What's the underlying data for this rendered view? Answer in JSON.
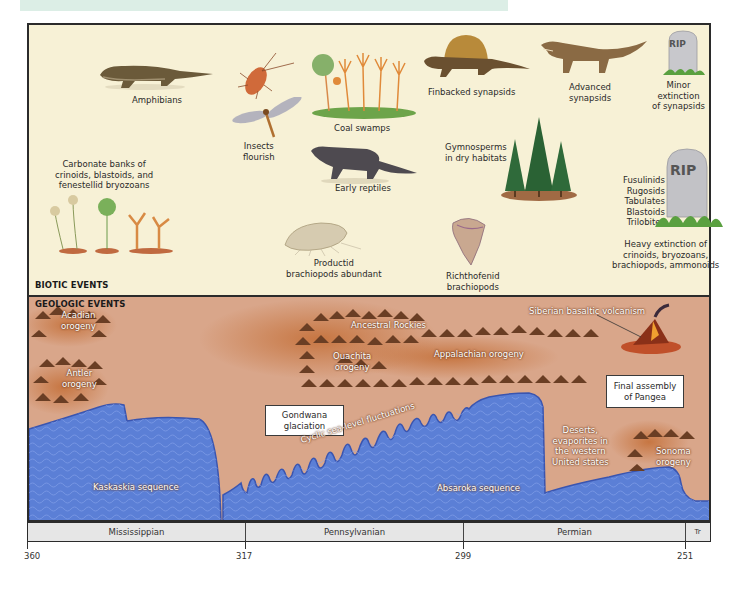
{
  "header": {
    "title_band_color": "#dceee6"
  },
  "biotic": {
    "section_label": "BIOTIC EVENTS",
    "background": "#f7f1d6",
    "events": [
      {
        "id": "amphibians",
        "label": "Amphibians"
      },
      {
        "id": "insects",
        "label_line1": "Insects",
        "label_line2": "flourish"
      },
      {
        "id": "coal-swamps",
        "label": "Coal swamps"
      },
      {
        "id": "finbacked",
        "label": "Finbacked synapsids"
      },
      {
        "id": "advanced",
        "label_line1": "Advanced",
        "label_line2": "synapsids"
      },
      {
        "id": "minor-extinction",
        "label_line1": "Minor",
        "label_line2": "extinction",
        "label_line3": "of synapsids",
        "tombstone": "RIP"
      },
      {
        "id": "carbonate-banks",
        "label_line1": "Carbonate banks of",
        "label_line2": "crinoids, blastoids, and",
        "label_line3": "fenestellid bryozoans"
      },
      {
        "id": "early-reptiles",
        "label": "Early reptiles"
      },
      {
        "id": "gymnosperms",
        "label_line1": "Gymnosperms",
        "label_line2": "in dry habitats"
      },
      {
        "id": "productid",
        "label_line1": "Productid",
        "label_line2": "brachiopods abundant"
      },
      {
        "id": "richthofenid",
        "label_line1": "Richthofenid",
        "label_line2": "brachiopods"
      },
      {
        "id": "extinct-list",
        "items": [
          "Fusulinids",
          "Rugosids",
          "Tabulates",
          "Blastoids",
          "Trilobites"
        ],
        "tombstone": "RIP"
      },
      {
        "id": "heavy-extinction",
        "label_line1": "Heavy extinction of",
        "label_line2": "crinoids, bryozoans,",
        "label_line3": "brachiopods, ammonoids"
      }
    ]
  },
  "geologic": {
    "section_label": "GEOLOGIC EVENTS",
    "background": "#d9a68a",
    "sea_color": "#5b7fd6",
    "events": {
      "acadian": {
        "line1": "Acadian",
        "line2": "orogeny"
      },
      "antler": {
        "line1": "Antler",
        "line2": "orogeny"
      },
      "ancestral_rockies": "Ancestral Rockies",
      "ouachita": {
        "line1": "Ouachita",
        "line2": "orogeny"
      },
      "appalachian": "Appalachian orogeny",
      "siberian": "Siberian basaltic volcanism",
      "pangea": {
        "line1": "Final assembly",
        "line2": "of Pangea"
      },
      "gondwana": {
        "line1": "Gondwana",
        "line2": "glaciation"
      },
      "cyclic": "Cyclic sea-level fluctuations",
      "kaskaskia": "Kaskaskia sequence",
      "absaroka": "Absaroka sequence",
      "deserts": {
        "line1": "Deserts,",
        "line2": "evaporites in",
        "line3": "the western",
        "line4": "United states"
      },
      "sonoma": {
        "line1": "Sonoma",
        "line2": "orogeny"
      }
    }
  },
  "timeline": {
    "periods": [
      {
        "name": "Mississippian"
      },
      {
        "name": "Pennsylvanian"
      },
      {
        "name": "Permian"
      },
      {
        "name": "Tr"
      }
    ],
    "ticks": [
      "360",
      "317",
      "299",
      "251"
    ],
    "unit_note": "Ma"
  }
}
